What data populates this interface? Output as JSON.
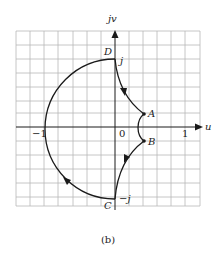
{
  "figure": {
    "caption": "(b)",
    "axes": {
      "horizontal_label": "u",
      "vertical_label": "jv",
      "tick_neg_one": "−1",
      "tick_zero": "0",
      "tick_one": "1"
    },
    "points": {
      "A": "A",
      "B": "B",
      "C": "C",
      "D": "D",
      "j": "j",
      "neg_j": "−j"
    },
    "colors": {
      "grid": "#b8b8b8",
      "curve": "#1a1a1a",
      "background": "#ffffff"
    }
  }
}
